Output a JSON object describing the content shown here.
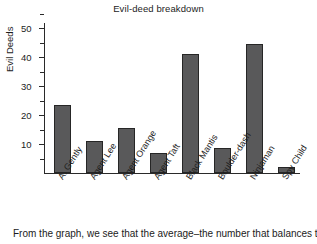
{
  "chart_data": {
    "type": "bar",
    "title": "Evil-deed breakdown",
    "xlabel": "",
    "ylabel": "Evil Deeds",
    "categories": [
      "A. Gently",
      "Agent Lee",
      "Agent Orange",
      "Agent Taft",
      "Black Mantis",
      "Boulder-dash",
      "Ninjaman",
      "Spy Child"
    ],
    "values": [
      23.5,
      11,
      15.5,
      7,
      41,
      8.5,
      44.5,
      2
    ],
    "ylim": [
      0,
      55
    ],
    "yticks_major": [
      10,
      20,
      30,
      40,
      50
    ],
    "yticks_minor": [
      5,
      15,
      25,
      35,
      45,
      55
    ],
    "ytick_labels": [
      "10",
      "20",
      "30",
      "40",
      "50"
    ],
    "grid": false,
    "legend": null,
    "bar_color": "#59595a",
    "bar_edge_color": "#262626",
    "axis_color": "#2a2a2a"
  },
  "caption": {
    "text": "From the graph, we see that the average–the number that balances the"
  }
}
